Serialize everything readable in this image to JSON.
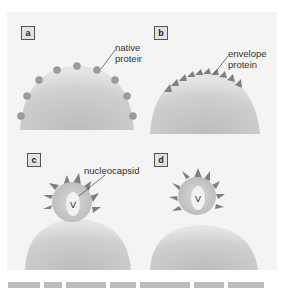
{
  "figure": {
    "panels": [
      {
        "id": "a",
        "label": "a",
        "callout": [
          "native",
          "protein"
        ],
        "stage": "native proteins in host membrane"
      },
      {
        "id": "b",
        "label": "b",
        "callout": [
          "envelope",
          "protein"
        ],
        "stage": "envelope proteins inserted into membrane"
      },
      {
        "id": "c",
        "label": "c",
        "callout": [
          "nucleocapsid"
        ],
        "inner_letter": "V",
        "stage": "nucleocapsid begins budding"
      },
      {
        "id": "d",
        "label": "d",
        "inner_letter": "V",
        "stage": "virion buds from cell"
      }
    ],
    "colors": {
      "cell": "#c8c8c8",
      "cell_highlight": "#e6e6e6",
      "protein_dot": "#9a9a9a",
      "spike": "#7f7f7f",
      "virus_core": "#efefef",
      "panel_bg": "#f4f4f4"
    }
  },
  "caption": {
    "visible": "truncated"
  }
}
